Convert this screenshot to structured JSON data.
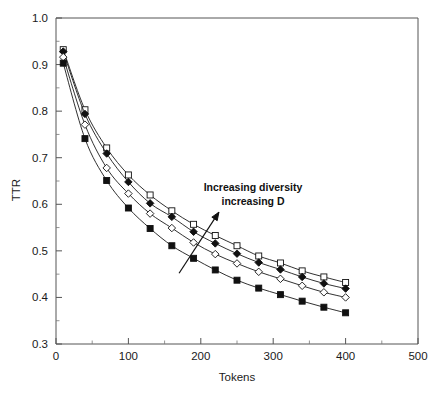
{
  "chart_data": {
    "type": "line",
    "title": "",
    "xlabel": "Tokens",
    "ylabel": "TTR",
    "xlim": [
      0,
      500
    ],
    "ylim": [
      0.3,
      1.0
    ],
    "xticks": [
      0,
      100,
      200,
      300,
      400,
      500
    ],
    "xtick_labels": [
      "0",
      "100",
      "200",
      "300",
      "400",
      "500"
    ],
    "xminor_step": 50,
    "yticks": [
      0.3,
      0.4,
      0.5,
      0.6,
      0.7,
      0.8,
      0.9,
      1.0
    ],
    "ytick_labels": [
      "0.3",
      "0.4",
      "0.5",
      "0.6",
      "0.7",
      "0.8",
      "0.9",
      "1.0"
    ],
    "yminor_step": 0.05,
    "grid": false,
    "legend": "none",
    "x": [
      10,
      40,
      70,
      100,
      130,
      160,
      190,
      220,
      250,
      280,
      310,
      340,
      370,
      400
    ],
    "series": [
      {
        "name": "D4",
        "marker": "open-square",
        "values": [
          0.932,
          0.803,
          0.721,
          0.663,
          0.62,
          0.586,
          0.557,
          0.533,
          0.511,
          0.489,
          0.474,
          0.457,
          0.444,
          0.432
        ]
      },
      {
        "name": "D3",
        "marker": "filled-diamond",
        "values": [
          0.928,
          0.794,
          0.709,
          0.648,
          0.602,
          0.573,
          0.541,
          0.516,
          0.494,
          0.475,
          0.46,
          0.444,
          0.43,
          0.419
        ]
      },
      {
        "name": "D2",
        "marker": "open-diamond",
        "values": [
          0.916,
          0.771,
          0.678,
          0.623,
          0.58,
          0.549,
          0.518,
          0.493,
          0.473,
          0.455,
          0.44,
          0.425,
          0.411,
          0.4
        ]
      },
      {
        "name": "D1",
        "marker": "filled-square",
        "values": [
          0.903,
          0.741,
          0.651,
          0.592,
          0.548,
          0.511,
          0.484,
          0.459,
          0.437,
          0.42,
          0.406,
          0.392,
          0.379,
          0.367
        ]
      }
    ],
    "annotations": [
      {
        "name": "increasing-diversity",
        "line1": "Increasing diversity",
        "line2": "increasing D",
        "arrow": {
          "x1": 170,
          "y1": 0.452,
          "x2": 225,
          "y2": 0.583
        }
      }
    ],
    "colors": {
      "line": "#1a1a1a",
      "marker_fill_open": "#ffffff",
      "marker_fill_closed": "#111111",
      "axis": "#555555",
      "background": "#ffffff"
    }
  }
}
